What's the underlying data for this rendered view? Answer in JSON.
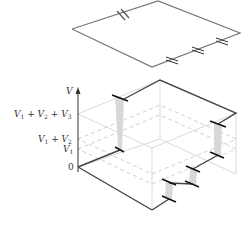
{
  "figure": {
    "type": "circuit-potential-diagram",
    "top_circuit": {
      "description": "Series circuit with one battery and three resistors",
      "battery_count": 1,
      "resistor_count": 3
    },
    "axis": {
      "label": "V",
      "ticks": [
        {
          "id": "v123",
          "text": "V1 + V2 + V3"
        },
        {
          "id": "v12",
          "text": "V1 + V2"
        },
        {
          "id": "v1",
          "text": "V1"
        },
        {
          "id": "zero",
          "text": "0"
        }
      ]
    },
    "colors": {
      "circuit": "#666666",
      "thick_line": "#333333",
      "box": "#cccccc",
      "dashed": "#bbbbbb",
      "fill": "#d6d6d6"
    }
  }
}
